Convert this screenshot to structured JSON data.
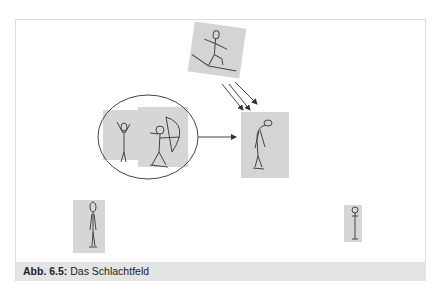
{
  "figure": {
    "caption_label": "Abb. 6.5:",
    "caption_text": "Das Schlachtfeld"
  },
  "scene": {
    "panels": [
      {
        "id": "skier",
        "description": "stick figure skiing / sliding on a board",
        "rotated": true
      },
      {
        "id": "waving",
        "description": "stick figure with raised hand"
      },
      {
        "id": "archer",
        "description": "stick figure drawing a bow"
      },
      {
        "id": "hit",
        "description": "stick figure hunched over, hit"
      },
      {
        "id": "standing-left",
        "description": "tall standing stick figure"
      },
      {
        "id": "standing-right",
        "description": "small standing stick figure"
      }
    ],
    "arrows": [
      {
        "from": "skier",
        "to": "hit",
        "count": 3
      },
      {
        "from": "archer-circle",
        "to": "hit",
        "count": 1
      }
    ],
    "colors": {
      "panel": "#d6d6d6",
      "line": "#444444",
      "frame": "#dcdcdc",
      "caption_bg": "#e4e4e4"
    }
  }
}
